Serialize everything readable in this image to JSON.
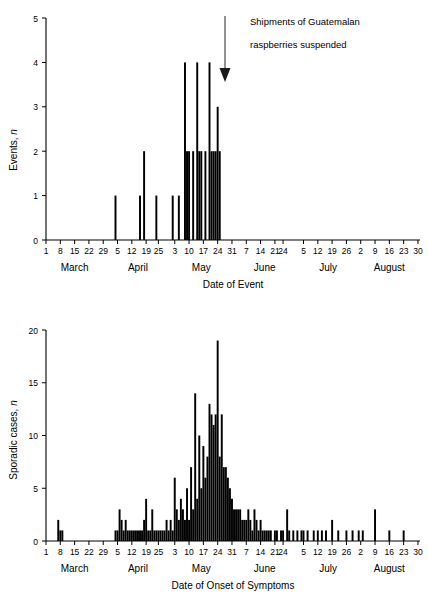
{
  "figure": {
    "panels": [
      {
        "id": "events-panel",
        "ylabel_text": "Events, ",
        "ylabel_italic": "n",
        "xlabel": "Date of Event",
        "annotation_line1": "Shipments of Guatemalan",
        "annotation_line2": "raspberries suspended",
        "annotation_icon": "down-arrow-icon"
      },
      {
        "id": "cases-panel",
        "ylabel_text": "Sporadic cases, ",
        "ylabel_italic": "n",
        "xlabel": "Date of Onset of Symptoms"
      }
    ],
    "months": [
      "March",
      "April",
      "May",
      "June",
      "July",
      "August"
    ],
    "bar_color": "#000000"
  },
  "chart_data": [
    {
      "type": "bar",
      "id": "events-epidemic-curve",
      "title": "",
      "xlabel": "Date of Event",
      "ylabel": "Events, n",
      "ylim": [
        0,
        5
      ],
      "yticks": [
        0,
        1,
        2,
        3,
        4,
        5
      ],
      "grid": false,
      "legend": null,
      "xlim_days": [
        0,
        183
      ],
      "x_tick_days": [
        0,
        7,
        14,
        21,
        28,
        35,
        42,
        49,
        55,
        63,
        70,
        77,
        84,
        91,
        98,
        105,
        112,
        116,
        126,
        133,
        140,
        147,
        154,
        161,
        168,
        175,
        182
      ],
      "x_tick_labels": [
        "1",
        "8",
        "15",
        "22",
        "29",
        "5",
        "12",
        "19",
        "25",
        "3",
        "10",
        "17",
        "24",
        "31",
        "7",
        "14",
        "21",
        "24",
        "5",
        "12",
        "19",
        "26",
        "2",
        "9",
        "16",
        "23",
        "30"
      ],
      "month_labels": [
        "March",
        "April",
        "May",
        "June",
        "July",
        "August"
      ],
      "month_label_days": [
        14,
        45,
        76,
        107,
        138,
        168
      ],
      "annotation": {
        "text": "Shipments of Guatemalan raspberries suspended",
        "arrow_at_day": 117,
        "arrow_points_to_value": 3.85
      },
      "categories": [
        34,
        46,
        48,
        54,
        62,
        65,
        68,
        69,
        70,
        72,
        74,
        75,
        76,
        78,
        80,
        81,
        82,
        83,
        84,
        85
      ],
      "values": [
        1,
        1,
        2,
        1,
        1,
        1,
        4,
        2,
        2,
        2,
        4,
        2,
        2,
        2,
        4,
        2,
        2,
        2,
        3,
        2
      ],
      "note": "x positions are days since March 1; bars are single-day counts"
    },
    {
      "type": "bar",
      "id": "sporadic-cases-epidemic-curve",
      "title": "",
      "xlabel": "Date of Onset of Symptoms",
      "ylabel": "Sporadic cases, n",
      "ylim": [
        0,
        20
      ],
      "yticks": [
        0,
        5,
        10,
        15,
        20
      ],
      "grid": false,
      "legend": null,
      "xlim_days": [
        0,
        183
      ],
      "x_tick_days": [
        0,
        7,
        14,
        21,
        28,
        35,
        42,
        49,
        55,
        63,
        70,
        77,
        84,
        91,
        98,
        105,
        112,
        116,
        126,
        133,
        140,
        147,
        154,
        161,
        168,
        175,
        182
      ],
      "x_tick_labels": [
        "1",
        "8",
        "15",
        "22",
        "29",
        "5",
        "12",
        "19",
        "25",
        "3",
        "10",
        "17",
        "24",
        "31",
        "7",
        "14",
        "21",
        "24",
        "5",
        "12",
        "19",
        "26",
        "2",
        "9",
        "16",
        "23",
        "30"
      ],
      "month_labels": [
        "March",
        "April",
        "May",
        "June",
        "July",
        "August"
      ],
      "month_label_days": [
        14,
        45,
        76,
        107,
        138,
        168
      ],
      "categories": [
        6,
        7,
        8,
        34,
        35,
        36,
        37,
        38,
        39,
        40,
        41,
        42,
        43,
        44,
        45,
        46,
        47,
        48,
        49,
        50,
        51,
        52,
        53,
        54,
        55,
        56,
        57,
        58,
        59,
        60,
        61,
        62,
        63,
        64,
        65,
        66,
        67,
        68,
        69,
        70,
        71,
        72,
        73,
        74,
        75,
        76,
        77,
        78,
        79,
        80,
        81,
        82,
        83,
        84,
        85,
        86,
        87,
        88,
        89,
        90,
        91,
        92,
        93,
        94,
        95,
        96,
        97,
        98,
        99,
        100,
        101,
        102,
        103,
        104,
        105,
        106,
        107,
        108,
        109,
        110,
        112,
        113,
        115,
        116,
        118,
        119,
        121,
        123,
        125,
        126,
        128,
        131,
        133,
        135,
        137,
        140,
        143,
        147,
        150,
        153,
        155,
        161,
        168,
        175
      ],
      "values": [
        2,
        1,
        1,
        1,
        1,
        3,
        2,
        1,
        2,
        1,
        1,
        1,
        1,
        1,
        1,
        1,
        1,
        2,
        4,
        1,
        1,
        3,
        1,
        1,
        1,
        1,
        1,
        1,
        2,
        1,
        2,
        1,
        6,
        3,
        2,
        4,
        3,
        2,
        5,
        2,
        7,
        3,
        14,
        4,
        10,
        5,
        9,
        6,
        8,
        13,
        12,
        11,
        12,
        19,
        8,
        12,
        7,
        7,
        6,
        5,
        4,
        3,
        3,
        3,
        3,
        2,
        2,
        2,
        3,
        2,
        1,
        3,
        2,
        1,
        2,
        1,
        1,
        1,
        1,
        1,
        1,
        1,
        1,
        1,
        3,
        1,
        1,
        1,
        1,
        1,
        1,
        1,
        1,
        1,
        1,
        2,
        1,
        1,
        1,
        1,
        1,
        3,
        1,
        1
      ],
      "note": "x positions are days since March 1; bars are single-day case counts"
    }
  ]
}
